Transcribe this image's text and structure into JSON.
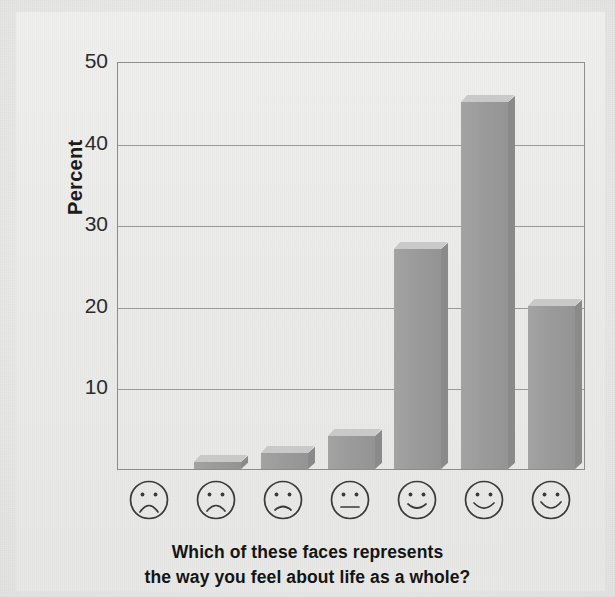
{
  "chart_data": {
    "type": "bar",
    "title": "",
    "xlabel": "Which of these faces represents the way you feel about life as a whole?",
    "ylabel": "Percent",
    "ylim": [
      0,
      50
    ],
    "yticks": [
      10,
      20,
      30,
      40,
      50
    ],
    "grid": true,
    "legend": "none",
    "categories": [
      "very-sad-face",
      "sad-face",
      "slightly-sad-face",
      "neutral-face",
      "slightly-happy-face",
      "happy-face",
      "very-happy-face"
    ],
    "category_labels": [
      "",
      "",
      "",
      "",
      "",
      "",
      ""
    ],
    "values": [
      0,
      0.8,
      2,
      4,
      27,
      45,
      20
    ],
    "bar_color": "#9b9b9b",
    "bar_top_color": "#c9c9c9",
    "bar_side_color": "#8a8a8a"
  },
  "axis": {
    "y_label": "Percent",
    "y_ticks": [
      {
        "value": 50,
        "label": "50"
      },
      {
        "value": 40,
        "label": "40"
      },
      {
        "value": 30,
        "label": "30"
      },
      {
        "value": 20,
        "label": "20"
      },
      {
        "value": 10,
        "label": "10"
      }
    ]
  },
  "caption": {
    "line1": "Which of these faces represents",
    "line2": "the way you feel about life as a whole?"
  },
  "colors": {
    "background": "#e9e9e7",
    "plot_border": "#8d8d8d",
    "gridline": "#9a9a9a",
    "bar": "#9b9b9b",
    "text": "#1b1b1b",
    "face_stroke": "#3a3a3a"
  }
}
